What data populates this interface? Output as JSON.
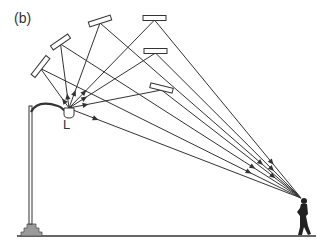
{
  "figure": {
    "panel_label": "(b)",
    "lamp_label": "L",
    "colors": {
      "line": "#333333",
      "mirror_fill": "#ffffff",
      "base_fill": "#9a9a9a"
    },
    "lamp": {
      "x": 69,
      "y": 112
    },
    "eye": {
      "x": 301,
      "y": 198
    },
    "ground": {
      "x1": 17,
      "x2": 316,
      "y": 236
    },
    "mirrors": [
      {
        "cx": 40.5,
        "cy": 66.5,
        "len": 24,
        "angle": -52
      },
      {
        "cx": 60.5,
        "cy": 42,
        "len": 21,
        "angle": -35
      },
      {
        "cx": 100,
        "cy": 21,
        "len": 23,
        "angle": -18
      },
      {
        "cx": 154.5,
        "cy": 18,
        "len": 23,
        "angle": 0
      },
      {
        "cx": 155.5,
        "cy": 51,
        "len": 23,
        "angle": 0
      },
      {
        "cx": 161.5,
        "cy": 88,
        "len": 23,
        "angle": 14
      }
    ]
  }
}
